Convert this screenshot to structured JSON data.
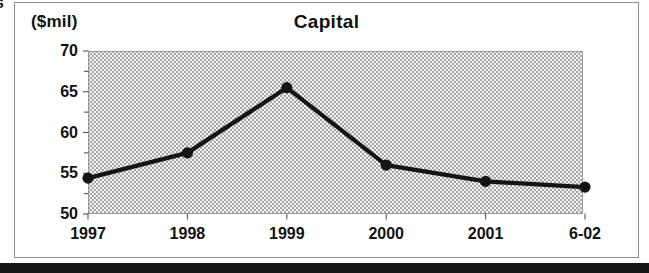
{
  "page": {
    "corner_fragment": "s",
    "bottom_bar_color": "#161616",
    "frame_border_color": "#8f8f8f"
  },
  "chart_data": {
    "type": "line",
    "title": "Capital",
    "ylabel": "($mil)",
    "xlabel": "",
    "x": [
      "1997",
      "1998",
      "1999",
      "2000",
      "2001",
      "6-02"
    ],
    "values": [
      54.4,
      57.5,
      65.5,
      56.0,
      54.0,
      53.3
    ],
    "series_name": "Capital ($mil)",
    "ylim": [
      50,
      70
    ],
    "yticks": [
      50,
      55,
      60,
      65,
      70
    ],
    "minor_tick_step": 2.5,
    "grid": "off",
    "legend": "none",
    "line_color": "#141414",
    "marker": "filled-circle",
    "plot_background": "gray halftone dot pattern",
    "tick_color": "#555555"
  }
}
